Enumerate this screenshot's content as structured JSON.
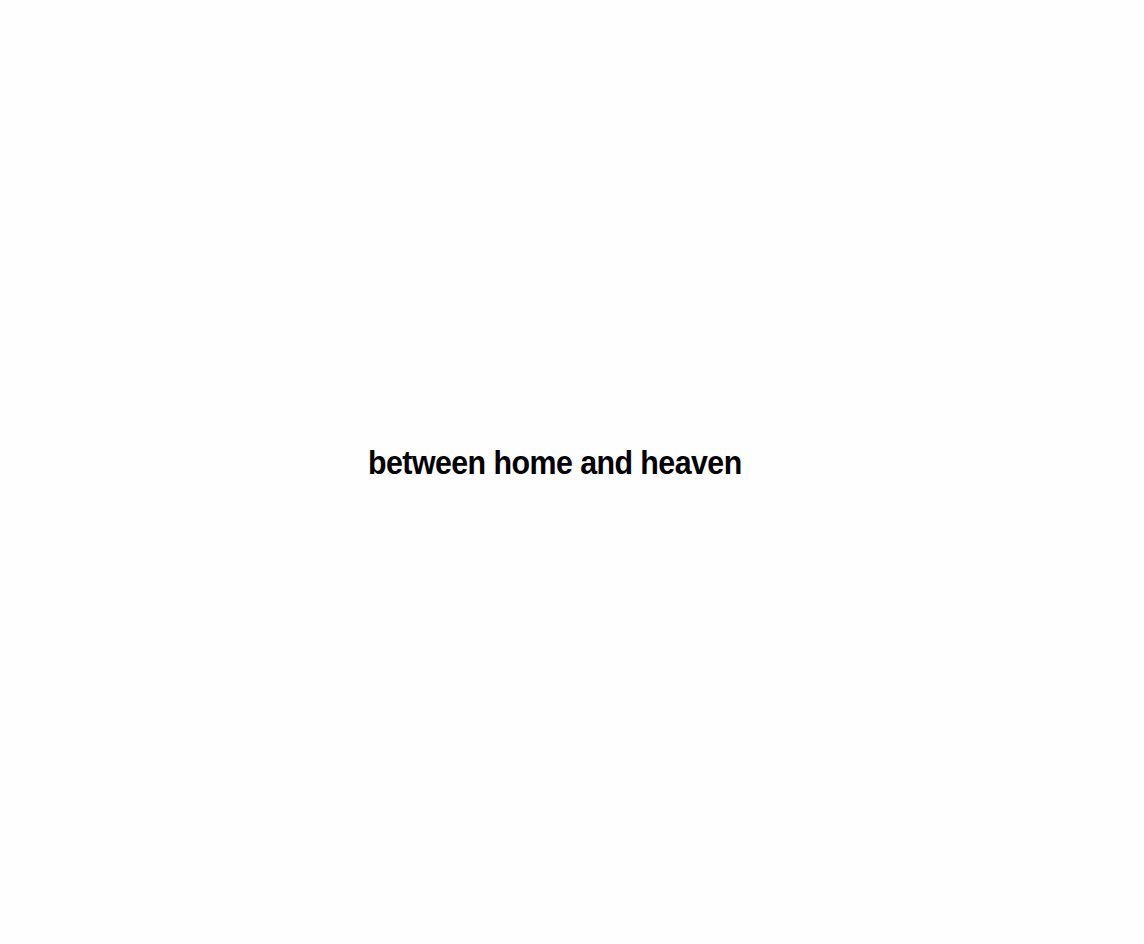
{
  "page": {
    "background": "#ffffff",
    "title": "between home and heaven",
    "text_color": "#000000"
  }
}
